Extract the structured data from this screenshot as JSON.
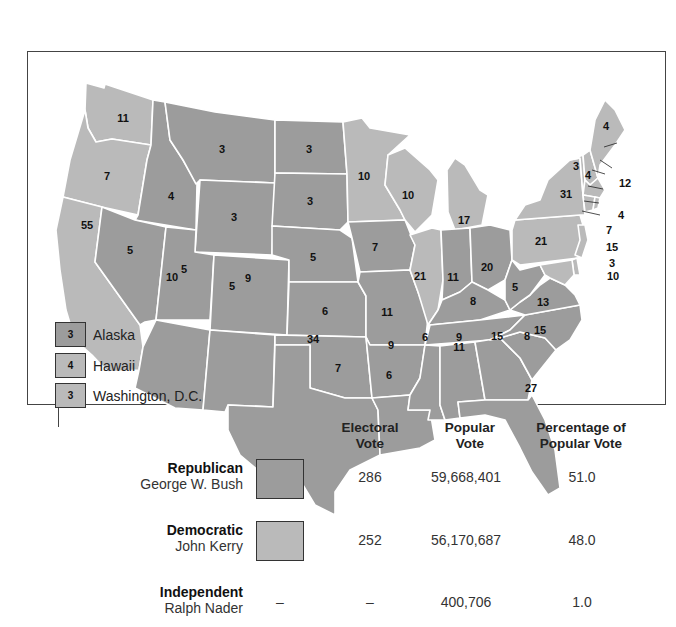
{
  "map": {
    "title": "",
    "colors": {
      "republican": "#9c9c9c",
      "democratic": "#bababa",
      "border": "#ffffff"
    },
    "states": [
      {
        "abbr": "WA",
        "party": "D",
        "ev": "11"
      },
      {
        "abbr": "OR",
        "party": "D",
        "ev": "7"
      },
      {
        "abbr": "CA",
        "party": "D",
        "ev": "55"
      },
      {
        "abbr": "ID",
        "party": "R",
        "ev": "4"
      },
      {
        "abbr": "NV",
        "party": "R",
        "ev": "5"
      },
      {
        "abbr": "MT",
        "party": "R",
        "ev": "3"
      },
      {
        "abbr": "WY",
        "party": "R",
        "ev": "3"
      },
      {
        "abbr": "UT",
        "party": "R",
        "ev": "5"
      },
      {
        "abbr": "CO",
        "party": "R",
        "ev": "9"
      },
      {
        "abbr": "AZ",
        "party": "R",
        "ev": "10"
      },
      {
        "abbr": "NM",
        "party": "R",
        "ev": "5"
      },
      {
        "abbr": "ND",
        "party": "R",
        "ev": "3"
      },
      {
        "abbr": "SD",
        "party": "R",
        "ev": "3"
      },
      {
        "abbr": "NE",
        "party": "R",
        "ev": "5"
      },
      {
        "abbr": "KS",
        "party": "R",
        "ev": "6"
      },
      {
        "abbr": "OK",
        "party": "R",
        "ev": "7"
      },
      {
        "abbr": "TX",
        "party": "R",
        "ev": "34"
      },
      {
        "abbr": "MN",
        "party": "D",
        "ev": "10"
      },
      {
        "abbr": "IA",
        "party": "R",
        "ev": "7"
      },
      {
        "abbr": "MO",
        "party": "R",
        "ev": "11"
      },
      {
        "abbr": "AR",
        "party": "R",
        "ev": "6"
      },
      {
        "abbr": "LA",
        "party": "R",
        "ev": "9"
      },
      {
        "abbr": "WI",
        "party": "D",
        "ev": "10"
      },
      {
        "abbr": "IL",
        "party": "D",
        "ev": "21"
      },
      {
        "abbr": "MI",
        "party": "D",
        "ev": "17"
      },
      {
        "abbr": "IN",
        "party": "R",
        "ev": "11"
      },
      {
        "abbr": "OH",
        "party": "R",
        "ev": "20"
      },
      {
        "abbr": "KY",
        "party": "R",
        "ev": "8"
      },
      {
        "abbr": "TN",
        "party": "R",
        "ev": "11"
      },
      {
        "abbr": "MS",
        "party": "R",
        "ev": "6"
      },
      {
        "abbr": "AL",
        "party": "R",
        "ev": "9"
      },
      {
        "abbr": "GA",
        "party": "R",
        "ev": "15"
      },
      {
        "abbr": "FL",
        "party": "R",
        "ev": "27"
      },
      {
        "abbr": "SC",
        "party": "R",
        "ev": "8"
      },
      {
        "abbr": "NC",
        "party": "R",
        "ev": "15"
      },
      {
        "abbr": "VA",
        "party": "R",
        "ev": "13"
      },
      {
        "abbr": "WV",
        "party": "R",
        "ev": "5"
      },
      {
        "abbr": "PA",
        "party": "D",
        "ev": "21"
      },
      {
        "abbr": "NY",
        "party": "D",
        "ev": "31"
      },
      {
        "abbr": "VT",
        "party": "D",
        "ev": "3"
      },
      {
        "abbr": "NH",
        "party": "D",
        "ev": "4"
      },
      {
        "abbr": "ME",
        "party": "D",
        "ev": "4"
      },
      {
        "abbr": "MA",
        "party": "D",
        "ev": "12"
      },
      {
        "abbr": "RI",
        "party": "D",
        "ev": "4"
      },
      {
        "abbr": "CT",
        "party": "D",
        "ev": "7"
      },
      {
        "abbr": "NJ",
        "party": "D",
        "ev": "15"
      },
      {
        "abbr": "DE",
        "party": "D",
        "ev": "3"
      },
      {
        "abbr": "MD",
        "party": "D",
        "ev": "10"
      }
    ]
  },
  "legend": [
    {
      "ev": "3",
      "label": "Alaska",
      "party": "R"
    },
    {
      "ev": "4",
      "label": "Hawaii",
      "party": "D"
    },
    {
      "ev": "3",
      "label": "Washington, D.C.",
      "party": "D"
    }
  ],
  "table": {
    "headers": {
      "electoral_line1": "Electoral",
      "electoral_line2": "Vote",
      "popular_line1": "Popular",
      "popular_line2": "Vote",
      "pct_line1": "Percentage of",
      "pct_line2": "Popular Vote"
    },
    "rows": [
      {
        "party": "Republican",
        "candidate": "George W. Bush",
        "swatch": "#9c9c9c",
        "electoral": "286",
        "popular": "59,668,401",
        "percent": "51.0"
      },
      {
        "party": "Democratic",
        "candidate": "John Kerry",
        "swatch": "#bababa",
        "electoral": "252",
        "popular": "56,170,687",
        "percent": "48.0"
      },
      {
        "party": "Independent",
        "candidate": "Ralph Nader",
        "swatch_text": "–",
        "electoral": "–",
        "popular": "400,706",
        "percent": "1.0"
      }
    ]
  }
}
